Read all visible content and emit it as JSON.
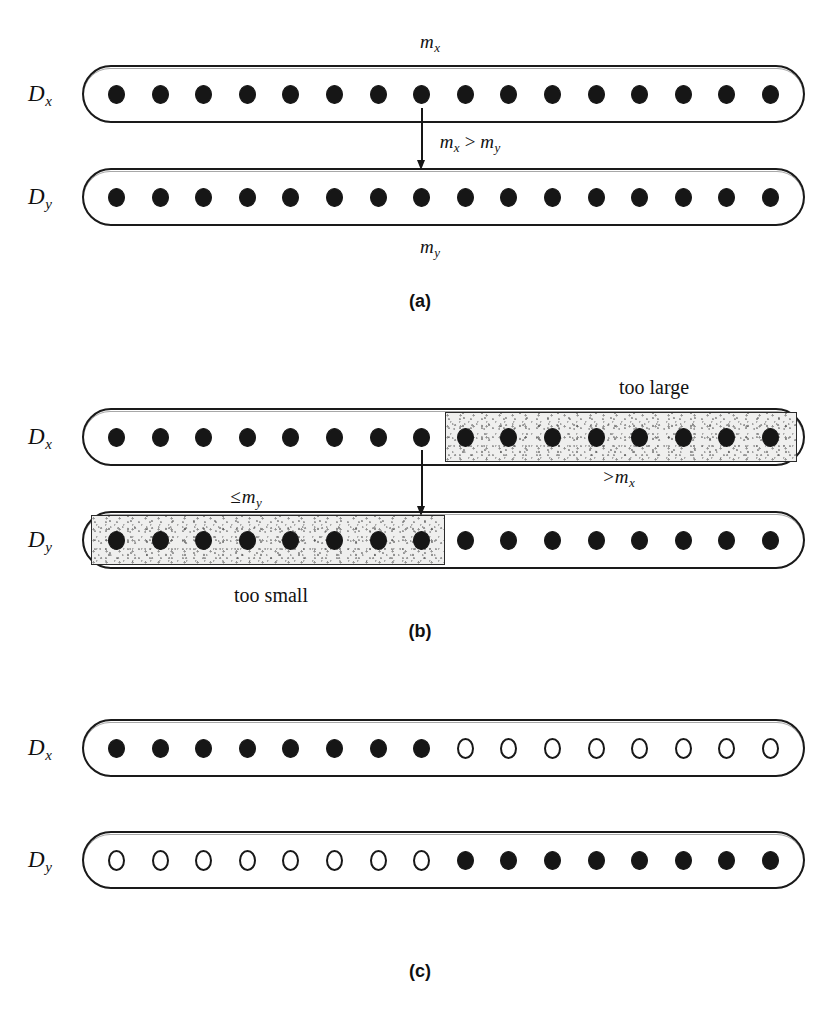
{
  "figure": {
    "total_slots_per_row": 16,
    "panels": [
      {
        "id": "a",
        "caption": "(a)",
        "caption_x": 420,
        "caption_y": 292,
        "top_label": {
          "text": "m",
          "sub": "x",
          "x": 420,
          "y": 32
        },
        "bottom_label": {
          "text": "m",
          "sub": "y",
          "x": 420,
          "y": 237
        },
        "middle_label": {
          "lhs": "m",
          "lhs_sub": "x",
          "operator": ">",
          "rhs": "m",
          "rhs_sub": "y",
          "x": 470,
          "y": 132
        },
        "arrow": {
          "x": 421,
          "y": 108,
          "height": 62
        },
        "rows": [
          {
            "name": "Dx",
            "label": "D",
            "label_sub": "x",
            "label_x": 28,
            "label_y": 82,
            "capsule": {
              "x": 82,
              "y": 65,
              "width": 723,
              "height": 58
            },
            "dots": [
              "filled",
              "filled",
              "filled",
              "filled",
              "filled",
              "filled",
              "filled",
              "filled",
              "filled",
              "filled",
              "filled",
              "filled",
              "filled",
              "filled",
              "filled",
              "filled"
            ],
            "shade": null
          },
          {
            "name": "Dy",
            "label": "D",
            "label_sub": "y",
            "label_x": 28,
            "label_y": 185,
            "capsule": {
              "x": 82,
              "y": 168,
              "width": 723,
              "height": 58
            },
            "dots": [
              "filled",
              "filled",
              "filled",
              "filled",
              "filled",
              "filled",
              "filled",
              "filled",
              "filled",
              "filled",
              "filled",
              "filled",
              "filled",
              "filled",
              "filled",
              "filled"
            ],
            "shade": null
          }
        ]
      },
      {
        "id": "b",
        "caption": "(b)",
        "caption_x": 420,
        "caption_y": 622,
        "top_label": null,
        "bottom_label": null,
        "middle_label": null,
        "arrow": {
          "x": 421,
          "y": 450,
          "height": 66
        },
        "annotations": [
          {
            "name": "too-large-note",
            "kind": "text",
            "text": "too large",
            "x": 654,
            "y": 377
          },
          {
            "name": "too-small-note",
            "kind": "text",
            "text": "too small",
            "x": 271,
            "y": 585
          },
          {
            "name": "greater-than-mx-label",
            "kind": "math",
            "rel": ">",
            "base": "m",
            "sub": "x",
            "x": 619,
            "y": 467
          },
          {
            "name": "at-most-my-label",
            "kind": "math",
            "rel": "≤",
            "base": "m",
            "sub": "y",
            "x": 246,
            "y": 487
          }
        ],
        "rows": [
          {
            "name": "Dx",
            "label": "D",
            "label_sub": "x",
            "label_x": 28,
            "label_y": 425,
            "capsule": {
              "x": 82,
              "y": 408,
              "width": 723,
              "height": 58
            },
            "dots": [
              "filled",
              "filled",
              "filled",
              "filled",
              "filled",
              "filled",
              "filled",
              "filled",
              "filled",
              "filled",
              "filled",
              "filled",
              "filled",
              "filled",
              "filled",
              "filled"
            ],
            "shade": {
              "x": 445,
              "y": 412,
              "width": 352,
              "height": 50
            }
          },
          {
            "name": "Dy",
            "label": "D",
            "label_sub": "y",
            "label_x": 28,
            "label_y": 528,
            "capsule": {
              "x": 82,
              "y": 511,
              "width": 723,
              "height": 58
            },
            "dots": [
              "filled",
              "filled",
              "filled",
              "filled",
              "filled",
              "filled",
              "filled",
              "filled",
              "filled",
              "filled",
              "filled",
              "filled",
              "filled",
              "filled",
              "filled",
              "filled"
            ],
            "shade": {
              "x": 91,
              "y": 515,
              "width": 354,
              "height": 50
            }
          }
        ]
      },
      {
        "id": "c",
        "caption": "(c)",
        "caption_x": 420,
        "caption_y": 962,
        "top_label": null,
        "bottom_label": null,
        "middle_label": null,
        "arrow": null,
        "rows": [
          {
            "name": "Dx",
            "label": "D",
            "label_sub": "x",
            "label_x": 28,
            "label_y": 736,
            "capsule": {
              "x": 82,
              "y": 719,
              "width": 723,
              "height": 58
            },
            "dots": [
              "filled",
              "filled",
              "filled",
              "filled",
              "filled",
              "filled",
              "filled",
              "filled",
              "hollow",
              "hollow",
              "hollow",
              "hollow",
              "hollow",
              "hollow",
              "hollow",
              "hollow"
            ],
            "shade": null
          },
          {
            "name": "Dy",
            "label": "D",
            "label_sub": "y",
            "label_x": 28,
            "label_y": 848,
            "capsule": {
              "x": 82,
              "y": 831,
              "width": 723,
              "height": 58
            },
            "dots": [
              "hollow",
              "hollow",
              "hollow",
              "hollow",
              "hollow",
              "hollow",
              "hollow",
              "hollow",
              "filled",
              "filled",
              "filled",
              "filled",
              "filled",
              "filled",
              "filled",
              "filled"
            ],
            "shade": null
          }
        ]
      }
    ]
  },
  "colors": {
    "ink": "#161616",
    "paper": "#ffffff",
    "shade_fill": "#efefee",
    "shade_border": "#2a2a2a"
  }
}
